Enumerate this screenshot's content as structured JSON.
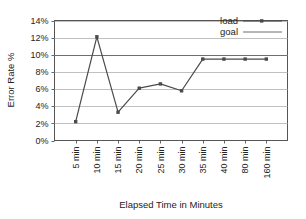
{
  "chart_data": {
    "type": "line",
    "title": "",
    "xlabel": "Elapsed Time in Minutes",
    "ylabel": "Error Rate %",
    "categories": [
      "5 min",
      "10 min",
      "15 min",
      "20 min",
      "25 min",
      "30 min",
      "35 min",
      "40 min",
      "80 min",
      "160 min"
    ],
    "ylim": [
      0,
      14
    ],
    "ytick_labels": [
      "0%",
      "2%",
      "4%",
      "6%",
      "8%",
      "10%",
      "12%",
      "14%"
    ],
    "ytick_values": [
      0,
      2,
      4,
      6,
      8,
      10,
      12,
      14
    ],
    "grid": "horizontal",
    "legend_position": "top-right-inside",
    "series": [
      {
        "name": "load",
        "marker": "square",
        "values": [
          2.2,
          12.1,
          3.3,
          6.1,
          6.6,
          5.8,
          9.5,
          9.5,
          9.5,
          9.5
        ]
      },
      {
        "name": "goal",
        "marker": "none",
        "constant_value": 10.0,
        "values": [
          10.0,
          10.0,
          10.0,
          10.0,
          10.0,
          10.0,
          10.0,
          10.0,
          10.0,
          10.0
        ]
      }
    ],
    "colors": {
      "load_line": "#4a4a4a",
      "goal_line": "#6e6e6e",
      "grid": "#b9b9b9",
      "axis": "#555555",
      "text": "#232323",
      "background": "#ffffff"
    }
  },
  "legend": {
    "items": [
      {
        "label": "load"
      },
      {
        "label": "goal"
      }
    ]
  },
  "axes": {
    "y_title": "Error Rate %",
    "x_title": "Elapsed Time in Minutes"
  }
}
